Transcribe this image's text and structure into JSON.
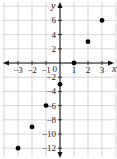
{
  "chart_data": {
    "type": "scatter",
    "title": "",
    "xlabel": "x",
    "ylabel": "y",
    "xlim": [
      -4,
      4
    ],
    "ylim": [
      -13,
      7
    ],
    "grid": true,
    "x_ticks": [
      "-3",
      "-2",
      "-1",
      "1",
      "2",
      "3"
    ],
    "y_ticks": [
      "6",
      "4",
      "2",
      "-2",
      "-4",
      "-6",
      "-8",
      "-10",
      "-12"
    ],
    "origin_label": "0",
    "series": [
      {
        "name": "points",
        "x": [
          -3,
          -2,
          -1,
          0,
          1,
          2,
          3
        ],
        "y": [
          -12,
          -9,
          -6,
          -3,
          0,
          3,
          6
        ]
      }
    ]
  }
}
